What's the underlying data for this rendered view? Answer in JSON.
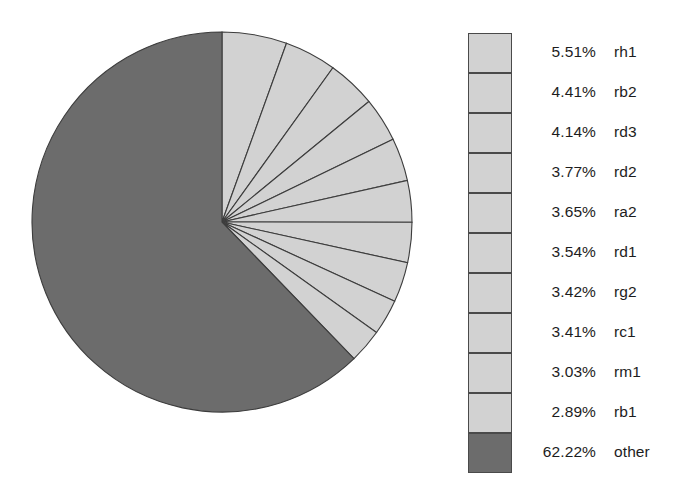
{
  "chart_data": {
    "type": "pie",
    "title": "",
    "subtitle": "",
    "xlabel": "",
    "ylabel": "",
    "grid": false,
    "legend_position": "right",
    "start_angle_deg": 0,
    "direction": "clockwise",
    "total_labeled_pct": 100.0,
    "categories": [
      "rh1",
      "rb2",
      "rd3",
      "rd2",
      "ra2",
      "rd1",
      "rg2",
      "rc1",
      "rm1",
      "rb1",
      "other"
    ],
    "values": [
      5.51,
      4.41,
      4.14,
      3.77,
      3.65,
      3.54,
      3.42,
      3.41,
      3.03,
      2.89,
      62.22
    ],
    "value_labels": [
      "5.51%",
      "4.41%",
      "4.14%",
      "3.77%",
      "3.65%",
      "3.54%",
      "3.42%",
      "3.41%",
      "3.03%",
      "2.89%",
      "62.22%"
    ],
    "slice_colors": [
      "#d2d2d2",
      "#d2d2d2",
      "#d2d2d2",
      "#d2d2d2",
      "#d2d2d2",
      "#d2d2d2",
      "#d2d2d2",
      "#d2d2d2",
      "#d2d2d2",
      "#d2d2d2",
      "#6c6c6c"
    ],
    "slice_edge_color": "#3c3c3c",
    "colors": {
      "light_slice": "#d2d2d2",
      "other_slice": "#6c6c6c",
      "outline": "#3c3c3c",
      "text": "#1d1d1d",
      "background": "#ffffff"
    }
  },
  "pie": {
    "center_x": 192,
    "center_y": 192,
    "radius": 190
  },
  "legend": {
    "rows": [
      {
        "pct": "5.51%",
        "label": "rh1",
        "color": "#d2d2d2"
      },
      {
        "pct": "4.41%",
        "label": "rb2",
        "color": "#d2d2d2"
      },
      {
        "pct": "4.14%",
        "label": "rd3",
        "color": "#d2d2d2"
      },
      {
        "pct": "3.77%",
        "label": "rd2",
        "color": "#d2d2d2"
      },
      {
        "pct": "3.65%",
        "label": "ra2",
        "color": "#d2d2d2"
      },
      {
        "pct": "3.54%",
        "label": "rd1",
        "color": "#d2d2d2"
      },
      {
        "pct": "3.42%",
        "label": "rg2",
        "color": "#d2d2d2"
      },
      {
        "pct": "3.41%",
        "label": "rc1",
        "color": "#d2d2d2"
      },
      {
        "pct": "3.03%",
        "label": "rm1",
        "color": "#d2d2d2"
      },
      {
        "pct": "2.89%",
        "label": "rb1",
        "color": "#d2d2d2"
      },
      {
        "pct": "62.22%",
        "label": "other",
        "color": "#6c6c6c"
      }
    ]
  }
}
